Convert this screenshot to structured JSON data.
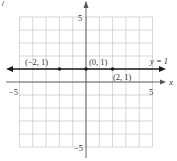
{
  "chart_data": {
    "type": "line",
    "title": "",
    "xlabel": "x",
    "ylabel": "y",
    "xlim": [
      -5,
      5
    ],
    "ylim": [
      -5,
      5
    ],
    "grid": true,
    "x_tick_labels": [
      "-5",
      "5"
    ],
    "y_tick_labels": [
      "5",
      "-5"
    ],
    "series": [
      {
        "name": "y = 1",
        "equation": "y = 1",
        "x": [
          -2,
          0,
          2
        ],
        "y": [
          1,
          1,
          1
        ],
        "extends_both_directions": true
      }
    ],
    "points": [
      {
        "x": -2,
        "y": 1,
        "label": "(−2, 1)"
      },
      {
        "x": 0,
        "y": 1,
        "label": "(0, 1)"
      },
      {
        "x": 2,
        "y": 1,
        "label": "(2, 1)"
      }
    ],
    "annotations": [
      {
        "text": "y = 1",
        "position": "right, above line"
      }
    ]
  },
  "labels": {
    "x_axis": "x",
    "y_axis": "y",
    "tick_x_neg": "−5",
    "tick_x_pos": "5",
    "tick_y_pos": "5",
    "tick_y_neg": "−5",
    "line_label": "y = 1",
    "pt_left": "(−2, 1)",
    "pt_mid": "(0, 1)",
    "pt_right": "(2, 1)"
  },
  "colors": {
    "grid": "#b8b8b8",
    "axis": "#555555",
    "line": "#1a1a1a",
    "text": "#333333"
  }
}
